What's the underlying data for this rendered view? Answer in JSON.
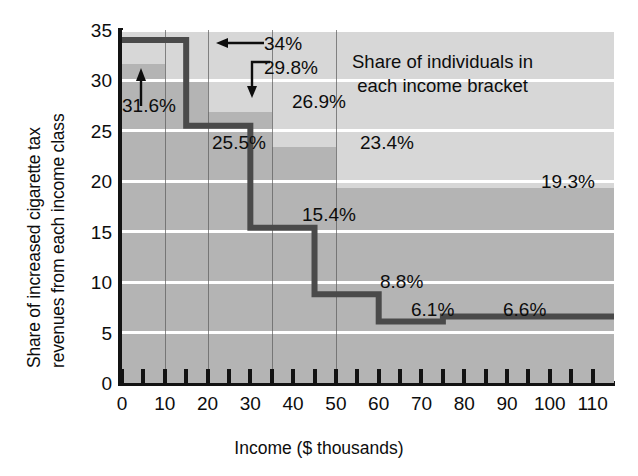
{
  "chart_data": {
    "type": "bar",
    "title": "",
    "xlabel": "Income ($ thousands)",
    "ylabel_line1": "Share of increased cigarette tax",
    "ylabel_line2": "revenues from each income class",
    "xlim": [
      0,
      115
    ],
    "ylim": [
      0,
      35
    ],
    "x_ticks": [
      0,
      5,
      10,
      15,
      20,
      25,
      30,
      35,
      40,
      45,
      50,
      55,
      60,
      65,
      70,
      75,
      80,
      85,
      90,
      95,
      100,
      105,
      110
    ],
    "x_tick_labels": [
      "0",
      "10",
      "20",
      "30",
      "40",
      "50",
      "60",
      "70",
      "80",
      "90",
      "100",
      "110"
    ],
    "x_tick_label_values": [
      0,
      10,
      20,
      30,
      40,
      50,
      60,
      70,
      80,
      90,
      100,
      110
    ],
    "y_ticks": [
      0,
      5,
      10,
      15,
      20,
      25,
      30,
      35
    ],
    "y_tick_labels": [
      "0",
      "5",
      "10",
      "15",
      "20",
      "25",
      "30",
      "35"
    ],
    "grid": "horizontal-white",
    "legend_position": "inside-top-right",
    "annotation": {
      "line1": "Share of individuals in",
      "line2": "each income bracket"
    },
    "series": [
      {
        "name": "Share of individuals in each income bracket",
        "style": "step-area-light",
        "color": "#d7d7d7",
        "bins": [
          {
            "x0": 0,
            "x1": 10,
            "value": 31.6,
            "label": "31.6%"
          },
          {
            "x0": 10,
            "x1": 20,
            "value": 29.8,
            "label": "29.8%"
          },
          {
            "x0": 20,
            "x1": 35,
            "value": 26.9,
            "label": "26.9%"
          },
          {
            "x0": 35,
            "x1": 50,
            "value": 23.4,
            "label": "23.4%"
          },
          {
            "x0": 50,
            "x1": 115,
            "value": 19.3,
            "label": "19.3%"
          }
        ]
      },
      {
        "name": "Share of increased cigarette tax revenues from each income class",
        "style": "step-line-dark",
        "color": "#4a4a4a",
        "bins": [
          {
            "x0": 0,
            "x1": 15,
            "value": 34.0,
            "label": "34%"
          },
          {
            "x0": 15,
            "x1": 30,
            "value": 25.5,
            "label": "25.5%"
          },
          {
            "x0": 30,
            "x1": 45,
            "value": 15.4,
            "label": "15.4%"
          },
          {
            "x0": 45,
            "x1": 60,
            "value": 8.8,
            "label": "8.8%"
          },
          {
            "x0": 60,
            "x1": 75,
            "value": 6.1,
            "label": "6.1%"
          },
          {
            "x0": 75,
            "x1": 115,
            "value": 6.6,
            "label": "6.6%"
          }
        ]
      }
    ],
    "value_labels": [
      {
        "text": "34%",
        "series": "tax-revenue-share"
      },
      {
        "text": "31.6%",
        "series": "individual-share"
      },
      {
        "text": "29.8%",
        "series": "individual-share"
      },
      {
        "text": "26.9%",
        "series": "individual-share"
      },
      {
        "text": "25.5%",
        "series": "tax-revenue-share"
      },
      {
        "text": "23.4%",
        "series": "individual-share"
      },
      {
        "text": "19.3%",
        "series": "individual-share"
      },
      {
        "text": "15.4%",
        "series": "tax-revenue-share"
      },
      {
        "text": "8.8%",
        "series": "tax-revenue-share"
      },
      {
        "text": "6.1%",
        "series": "tax-revenue-share"
      },
      {
        "text": "6.6%",
        "series": "tax-revenue-share"
      }
    ],
    "colors": {
      "plot_background": "#b4b4b4",
      "light_band": "#d7d7d7",
      "mid_band": "#b4b4b4",
      "step_line": "#4a4a4a",
      "gridline": "#ffffff",
      "axis": "#131313",
      "text": "#0d0d0d"
    }
  }
}
